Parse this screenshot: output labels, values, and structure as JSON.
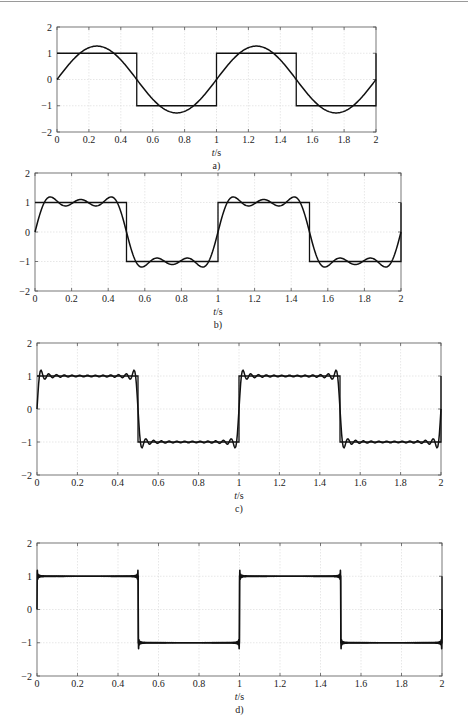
{
  "figure": {
    "top_rule_color": "#9a9a9a",
    "line_color": "#111111",
    "grid_color": "#d6d6d6",
    "axes_color": "#555555"
  },
  "chart_data": [
    {
      "type": "line",
      "caption": "a)",
      "title": "",
      "xlabel": "t/s",
      "ylabel": "",
      "xlim": [
        0,
        2
      ],
      "ylim": [
        -2,
        2
      ],
      "grid": true,
      "xticks": [
        0,
        0.2,
        0.4,
        0.6,
        0.8,
        1,
        1.2,
        1.4,
        1.6,
        1.8,
        2
      ],
      "xtick_labels": [
        "0",
        "0.2",
        "0.4",
        "0.6",
        "0.8",
        "1",
        "1.2",
        "1.4",
        "1.6",
        "1.8",
        "2"
      ],
      "yticks": [
        2,
        1,
        0,
        -1,
        -2
      ],
      "ytick_labels": [
        "2",
        "1",
        "0",
        "−1",
        "−2"
      ],
      "series": [
        {
          "name": "square wave",
          "kind": "square",
          "period": 1,
          "amplitude": 1
        },
        {
          "name": "Fourier approximation (fundamental only)",
          "kind": "fourier",
          "harmonics": [
            1
          ],
          "period": 1,
          "amplitude": 1,
          "peak_value": 1.27
        }
      ],
      "box": {
        "left": 57,
        "right": 376,
        "top": 27,
        "bottom": 132
      }
    },
    {
      "type": "line",
      "caption": "b)",
      "title": "",
      "xlabel": "t/s",
      "ylabel": "",
      "xlim": [
        0,
        2
      ],
      "ylim": [
        -2,
        2
      ],
      "grid": true,
      "xticks": [
        0,
        0.2,
        0.4,
        0.6,
        0.8,
        1,
        1.2,
        1.4,
        1.6,
        1.8,
        2
      ],
      "xtick_labels": [
        "0",
        "0.2",
        "0.4",
        "0.6",
        "0.8",
        "1",
        "1.2",
        "1.4",
        "1.6",
        "1.8",
        "2"
      ],
      "yticks": [
        2,
        1,
        0,
        -1,
        -2
      ],
      "ytick_labels": [
        "2",
        "1",
        "0",
        "−1",
        "−2"
      ],
      "series": [
        {
          "name": "square wave",
          "kind": "square",
          "period": 1,
          "amplitude": 1
        },
        {
          "name": "Fourier approximation (odd harmonics 1,3,5)",
          "kind": "fourier",
          "harmonics": [
            1,
            3,
            5
          ],
          "period": 1,
          "amplitude": 1,
          "peak_value": 1.18
        }
      ],
      "box": {
        "left": 35,
        "right": 401,
        "top": 173,
        "bottom": 291
      }
    },
    {
      "type": "line",
      "caption": "c)",
      "title": "",
      "xlabel": "t/s",
      "ylabel": "",
      "xlim": [
        0,
        2
      ],
      "ylim": [
        -2,
        2
      ],
      "grid": true,
      "xticks": [
        0,
        0.2,
        0.4,
        0.6,
        0.8,
        1,
        1.2,
        1.4,
        1.6,
        1.8,
        2
      ],
      "xtick_labels": [
        "0",
        "0.2",
        "0.4",
        "0.6",
        "0.8",
        "1",
        "1.2",
        "1.4",
        "1.6",
        "1.8",
        "2"
      ],
      "yticks": [
        2,
        1,
        0,
        -1,
        -2
      ],
      "ytick_labels": [
        "2",
        "1",
        "0",
        "−1",
        "−2"
      ],
      "series": [
        {
          "name": "square wave",
          "kind": "square",
          "period": 1,
          "amplitude": 1
        },
        {
          "name": "Fourier approximation (odd harmonics up to 25)",
          "kind": "fourier",
          "max_harmonic": 25,
          "period": 1,
          "amplitude": 1,
          "peak_value": 1.18
        }
      ],
      "box": {
        "left": 37,
        "right": 441,
        "top": 343,
        "bottom": 475
      }
    },
    {
      "type": "line",
      "caption": "d)",
      "title": "",
      "xlabel": "t/s",
      "ylabel": "",
      "xlim": [
        0,
        2
      ],
      "ylim": [
        -2,
        2
      ],
      "grid": true,
      "xticks": [
        0,
        0.2,
        0.4,
        0.6,
        0.8,
        1,
        1.2,
        1.4,
        1.6,
        1.8,
        2
      ],
      "xtick_labels": [
        "0",
        "0.2",
        "0.4",
        "0.6",
        "0.8",
        "1",
        "1.2",
        "1.4",
        "1.6",
        "1.8",
        "2"
      ],
      "yticks": [
        2,
        1,
        0,
        -1,
        -2
      ],
      "ytick_labels": [
        "2",
        "1",
        "0",
        "−1",
        "−2"
      ],
      "series": [
        {
          "name": "square wave",
          "kind": "square",
          "period": 1,
          "amplitude": 1
        },
        {
          "name": "Fourier approximation (many odd harmonics)",
          "kind": "fourier",
          "max_harmonic": 301,
          "period": 1,
          "amplitude": 1,
          "peak_value": 1.18
        }
      ],
      "box": {
        "left": 37,
        "right": 442,
        "top": 543,
        "bottom": 676
      }
    }
  ]
}
